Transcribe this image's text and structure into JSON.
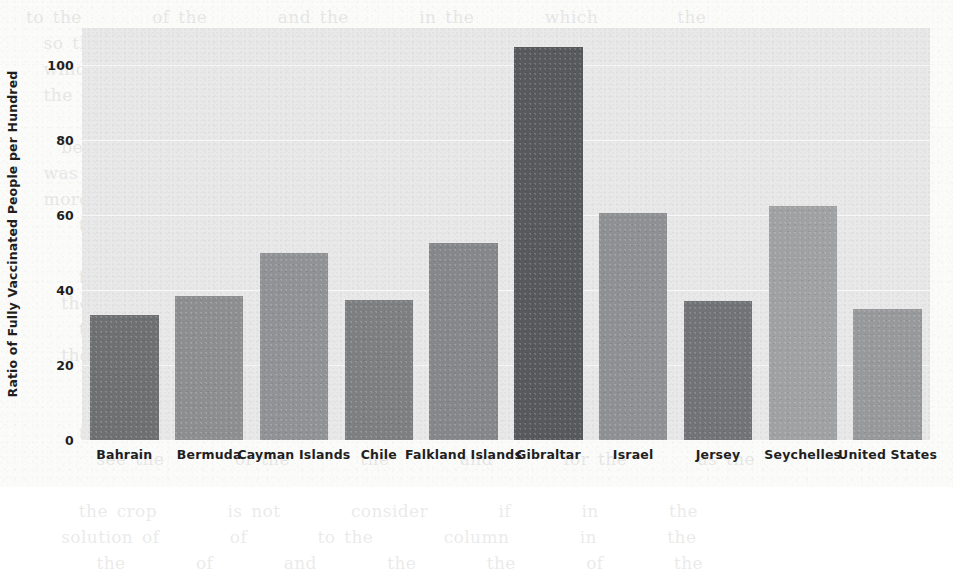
{
  "chart_data": {
    "type": "bar",
    "title": "",
    "subtitle": "",
    "xlabel": "",
    "ylabel": "Ratio of Fully Vaccinated People per Hundred",
    "categories": [
      "Bahrain",
      "Bermuda",
      "Cayman Islands",
      "Chile",
      "Falkland Islands",
      "Gibraltar",
      "Israel",
      "Jersey",
      "Seychelles",
      "United States"
    ],
    "values": [
      33.5,
      38.5,
      50,
      37.5,
      52.5,
      105,
      60.5,
      37,
      62.5,
      35
    ],
    "ylim": [
      0,
      110
    ],
    "yticks": [
      0,
      20,
      40,
      60,
      80,
      100
    ],
    "ytick_labels": [
      "0",
      "20",
      "40",
      "60",
      "80",
      "100"
    ],
    "grid": true,
    "legend": null,
    "bar_colors": [
      "#6f7072",
      "#8d8e90",
      "#919295",
      "#7e7f81",
      "#86878a",
      "#58595c",
      "#8f9093",
      "#727376",
      "#a0a1a3",
      "#98999b"
    ],
    "plot_background": "#e9e9e9",
    "gridline_color": "#f7f7f7",
    "text_color": "#1f1f1f"
  },
  "scan": {
    "ghost_text": "to the        of the        and the        in the        which         the\n  so that the empty        were        and the        of the        at the\n  which had the        so that the        of the        could not be        from\n  the        to the        and of the        in the        at the        of the\n\n    began with the        and the        in the        and the        again the\n  was not       of the        seen       the        of the        now the\n  more        that the        in the        and       the        for the\n      though the        was the        and the        to the        of the\n\n      the        of the        in the        the        that the        and\n    the        so the        of the        to the        with the        now\n      the        and the        by the        of the        for the        on\n    the        where the        in the        and the        of the        as\n\n        the        of the        and the        in the        to the        the\n      the        that        the        of the        with        the        and\n        see the        of the        the        and        for the        as the\n\n      the crop        is not        consider        if        in        the\n    solution of        of        to the        column        in        the\n        the        of        and        the        the        of        the"
  }
}
